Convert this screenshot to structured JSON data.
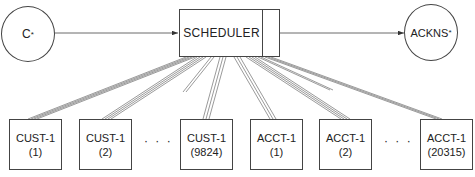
{
  "diagram": {
    "source": {
      "label": "C",
      "mark": "*"
    },
    "scheduler": {
      "label": "SCHEDULER"
    },
    "sink": {
      "label": "ACKNS",
      "mark": "*"
    },
    "ellipsis": "· · ·",
    "cust_boxes": [
      {
        "name": "CUST-1",
        "index": "(1)"
      },
      {
        "name": "CUST-1",
        "index": "(2)"
      },
      {
        "name": "CUST-1",
        "index": "(9824)"
      }
    ],
    "acct_boxes": [
      {
        "name": "ACCT-1",
        "index": "(1)"
      },
      {
        "name": "ACCT-1",
        "index": "(2)"
      },
      {
        "name": "ACCT-1",
        "index": "(20315)"
      }
    ]
  }
}
